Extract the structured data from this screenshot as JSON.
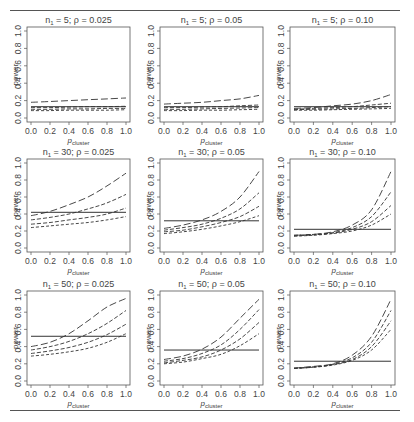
{
  "figure": {
    "rows": 3,
    "cols": 3,
    "ylabel": "power",
    "xlabel_main": "p",
    "xlabel_sub": "cluster",
    "x_ticks": [
      "0.0",
      "0.2",
      "0.4",
      "0.6",
      "0.8",
      "1.0"
    ],
    "y_ticks": [
      "0.0",
      "0.2",
      "0.4",
      "0.6",
      "0.8",
      "1.0"
    ],
    "line_color": "#333333",
    "axis_color": "#555555"
  },
  "chart_data": [
    {
      "type": "line",
      "title": "n1 = 5; ρ = 0.025",
      "n1": "5",
      "rho": "0.025",
      "xlabel": "p_cluster",
      "ylabel": "power",
      "xlim": [
        0,
        1
      ],
      "ylim": [
        0,
        1
      ],
      "x": [
        0.0,
        0.2,
        0.4,
        0.6,
        0.8,
        1.0
      ],
      "reference_line": 0.13,
      "series": [
        {
          "name": "curve-1",
          "style": "long-dash",
          "values": [
            0.18,
            0.19,
            0.2,
            0.21,
            0.22,
            0.23
          ]
        },
        {
          "name": "curve-2",
          "style": "dash",
          "values": [
            0.12,
            0.12,
            0.125,
            0.13,
            0.13,
            0.135
          ]
        },
        {
          "name": "curve-3",
          "style": "dash",
          "values": [
            0.1,
            0.1,
            0.105,
            0.105,
            0.11,
            0.11
          ]
        },
        {
          "name": "curve-4",
          "style": "short-dash",
          "values": [
            0.085,
            0.085,
            0.09,
            0.09,
            0.09,
            0.095
          ]
        }
      ]
    },
    {
      "type": "line",
      "title": "n1 = 5; ρ = 0.05",
      "n1": "5",
      "rho": "0.05",
      "xlabel": "p_cluster",
      "ylabel": "power",
      "xlim": [
        0,
        1
      ],
      "ylim": [
        0,
        1
      ],
      "x": [
        0.0,
        0.2,
        0.4,
        0.6,
        0.8,
        1.0
      ],
      "reference_line": 0.13,
      "series": [
        {
          "name": "curve-1",
          "style": "long-dash",
          "values": [
            0.16,
            0.17,
            0.18,
            0.2,
            0.22,
            0.26
          ]
        },
        {
          "name": "curve-2",
          "style": "dash",
          "values": [
            0.12,
            0.12,
            0.125,
            0.13,
            0.14,
            0.15
          ]
        },
        {
          "name": "curve-3",
          "style": "dash",
          "values": [
            0.1,
            0.1,
            0.105,
            0.11,
            0.115,
            0.12
          ]
        },
        {
          "name": "curve-4",
          "style": "short-dash",
          "values": [
            0.085,
            0.085,
            0.09,
            0.09,
            0.095,
            0.1
          ]
        }
      ]
    },
    {
      "type": "line",
      "title": "n1 = 5; ρ = 0.10",
      "n1": "5",
      "rho": "0.10",
      "xlabel": "p_cluster",
      "ylabel": "power",
      "xlim": [
        0,
        1
      ],
      "ylim": [
        0,
        1
      ],
      "x": [
        0.0,
        0.2,
        0.4,
        0.6,
        0.8,
        1.0
      ],
      "reference_line": 0.13,
      "series": [
        {
          "name": "curve-1",
          "style": "long-dash",
          "values": [
            0.11,
            0.12,
            0.14,
            0.16,
            0.2,
            0.27
          ]
        },
        {
          "name": "curve-2",
          "style": "dash",
          "values": [
            0.1,
            0.11,
            0.12,
            0.13,
            0.15,
            0.17
          ]
        },
        {
          "name": "curve-3",
          "style": "dash",
          "values": [
            0.095,
            0.1,
            0.105,
            0.11,
            0.12,
            0.13
          ]
        },
        {
          "name": "curve-4",
          "style": "short-dash",
          "values": [
            0.09,
            0.09,
            0.095,
            0.1,
            0.105,
            0.11
          ]
        }
      ]
    },
    {
      "type": "line",
      "title": "n1 = 30; ρ = 0.025",
      "n1": "30",
      "rho": "0.025",
      "xlabel": "p_cluster",
      "ylabel": "power",
      "xlim": [
        0,
        1
      ],
      "ylim": [
        0,
        1
      ],
      "x": [
        0.0,
        0.2,
        0.4,
        0.6,
        0.8,
        1.0
      ],
      "reference_line": 0.42,
      "series": [
        {
          "name": "curve-1",
          "style": "long-dash",
          "values": [
            0.38,
            0.43,
            0.51,
            0.6,
            0.73,
            0.88
          ]
        },
        {
          "name": "curve-2",
          "style": "dash",
          "values": [
            0.33,
            0.36,
            0.4,
            0.46,
            0.53,
            0.63
          ]
        },
        {
          "name": "curve-3",
          "style": "dash",
          "values": [
            0.28,
            0.3,
            0.33,
            0.36,
            0.4,
            0.47
          ]
        },
        {
          "name": "curve-4",
          "style": "short-dash",
          "values": [
            0.24,
            0.26,
            0.28,
            0.3,
            0.33,
            0.37
          ]
        }
      ]
    },
    {
      "type": "line",
      "title": "n1 = 30; ρ = 0.05",
      "n1": "30",
      "rho": "0.05",
      "xlabel": "p_cluster",
      "ylabel": "power",
      "xlim": [
        0,
        1
      ],
      "ylim": [
        0,
        1
      ],
      "x": [
        0.0,
        0.2,
        0.4,
        0.6,
        0.8,
        1.0
      ],
      "reference_line": 0.32,
      "series": [
        {
          "name": "curve-1",
          "style": "long-dash",
          "values": [
            0.23,
            0.27,
            0.33,
            0.43,
            0.6,
            0.9
          ]
        },
        {
          "name": "curve-2",
          "style": "dash",
          "values": [
            0.21,
            0.24,
            0.28,
            0.35,
            0.46,
            0.65
          ]
        },
        {
          "name": "curve-3",
          "style": "dash",
          "values": [
            0.19,
            0.21,
            0.25,
            0.3,
            0.37,
            0.49
          ]
        },
        {
          "name": "curve-4",
          "style": "short-dash",
          "values": [
            0.17,
            0.19,
            0.22,
            0.26,
            0.31,
            0.38
          ]
        }
      ]
    },
    {
      "type": "line",
      "title": "n1 = 30; ρ = 0.10",
      "n1": "30",
      "rho": "0.10",
      "xlabel": "p_cluster",
      "ylabel": "power",
      "xlim": [
        0,
        1
      ],
      "ylim": [
        0,
        1
      ],
      "x": [
        0.0,
        0.2,
        0.4,
        0.6,
        0.8,
        1.0
      ],
      "reference_line": 0.22,
      "series": [
        {
          "name": "curve-1",
          "style": "long-dash",
          "values": [
            0.15,
            0.16,
            0.19,
            0.27,
            0.45,
            0.9
          ]
        },
        {
          "name": "curve-2",
          "style": "dash",
          "values": [
            0.15,
            0.16,
            0.18,
            0.24,
            0.37,
            0.66
          ]
        },
        {
          "name": "curve-3",
          "style": "dash",
          "values": [
            0.14,
            0.155,
            0.175,
            0.22,
            0.31,
            0.5
          ]
        },
        {
          "name": "curve-4",
          "style": "short-dash",
          "values": [
            0.14,
            0.15,
            0.17,
            0.2,
            0.27,
            0.4
          ]
        }
      ]
    },
    {
      "type": "line",
      "title": "n1 = 50; ρ = 0.025",
      "n1": "50",
      "rho": "0.025",
      "xlabel": "p_cluster",
      "ylabel": "power",
      "xlim": [
        0,
        1
      ],
      "ylim": [
        0,
        1
      ],
      "x": [
        0.0,
        0.2,
        0.4,
        0.6,
        0.8,
        1.0
      ],
      "reference_line": 0.52,
      "series": [
        {
          "name": "curve-1",
          "style": "long-dash",
          "values": [
            0.4,
            0.45,
            0.55,
            0.7,
            0.86,
            0.96
          ]
        },
        {
          "name": "curve-2",
          "style": "dash",
          "values": [
            0.36,
            0.4,
            0.46,
            0.55,
            0.67,
            0.82
          ]
        },
        {
          "name": "curve-3",
          "style": "dash",
          "values": [
            0.32,
            0.35,
            0.39,
            0.45,
            0.54,
            0.66
          ]
        },
        {
          "name": "curve-4",
          "style": "short-dash",
          "values": [
            0.29,
            0.31,
            0.34,
            0.38,
            0.45,
            0.55
          ]
        }
      ]
    },
    {
      "type": "line",
      "title": "n1 = 50; ρ = 0.05",
      "n1": "50",
      "rho": "0.05",
      "xlabel": "p_cluster",
      "ylabel": "power",
      "xlim": [
        0,
        1
      ],
      "ylim": [
        0,
        1
      ],
      "x": [
        0.0,
        0.2,
        0.4,
        0.6,
        0.8,
        1.0
      ],
      "reference_line": 0.36,
      "series": [
        {
          "name": "curve-1",
          "style": "long-dash",
          "values": [
            0.25,
            0.29,
            0.37,
            0.51,
            0.73,
            0.95
          ]
        },
        {
          "name": "curve-2",
          "style": "dash",
          "values": [
            0.23,
            0.26,
            0.32,
            0.42,
            0.6,
            0.83
          ]
        },
        {
          "name": "curve-3",
          "style": "dash",
          "values": [
            0.21,
            0.24,
            0.28,
            0.36,
            0.49,
            0.68
          ]
        },
        {
          "name": "curve-4",
          "style": "short-dash",
          "values": [
            0.2,
            0.22,
            0.26,
            0.31,
            0.41,
            0.55
          ]
        }
      ]
    },
    {
      "type": "line",
      "title": "n1 = 50; ρ = 0.10",
      "n1": "50",
      "rho": "0.10",
      "xlabel": "p_cluster",
      "ylabel": "power",
      "xlim": [
        0,
        1
      ],
      "ylim": [
        0,
        1
      ],
      "x": [
        0.0,
        0.2,
        0.4,
        0.6,
        0.8,
        1.0
      ],
      "reference_line": 0.23,
      "series": [
        {
          "name": "curve-1",
          "style": "long-dash",
          "values": [
            0.15,
            0.17,
            0.2,
            0.3,
            0.52,
            0.95
          ]
        },
        {
          "name": "curve-2",
          "style": "dash",
          "values": [
            0.15,
            0.165,
            0.195,
            0.27,
            0.45,
            0.82
          ]
        },
        {
          "name": "curve-3",
          "style": "dash",
          "values": [
            0.145,
            0.16,
            0.19,
            0.25,
            0.4,
            0.7
          ]
        },
        {
          "name": "curve-4",
          "style": "short-dash",
          "values": [
            0.145,
            0.16,
            0.185,
            0.24,
            0.36,
            0.6
          ]
        }
      ]
    }
  ]
}
